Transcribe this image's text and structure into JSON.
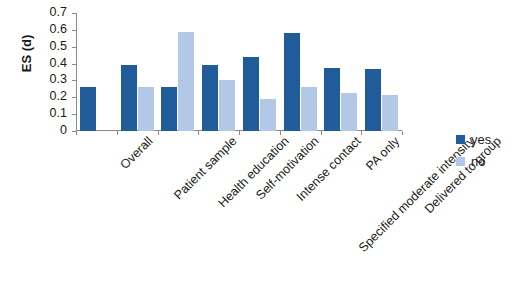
{
  "chart_data": {
    "type": "bar",
    "title": "",
    "subtitle": "",
    "xlabel": "",
    "ylabel": "ES (d)",
    "ylim": [
      0,
      0.7
    ],
    "ytick_labels": [
      "0.7",
      "0.6",
      "0.5",
      "0.4",
      "0.3",
      "0.2",
      "0.1",
      "0"
    ],
    "ytick_values": [
      0.7,
      0.6,
      0.5,
      0.4,
      0.3,
      0.2,
      0.1,
      0
    ],
    "grid": false,
    "legend_position": "right",
    "categories": [
      "Overall",
      "Patient sample",
      "Health education",
      "Self-motivation",
      "Intense contact",
      "Specified moderate intensity",
      "PA only",
      "Delivered to group"
    ],
    "series": [
      {
        "name": "yes",
        "color": "#1f5c99",
        "values": [
          0.26,
          0.39,
          0.26,
          0.39,
          0.44,
          0.58,
          0.375,
          0.365
        ]
      },
      {
        "name": "no",
        "color": "#b3c7e6",
        "values": [
          null,
          0.26,
          0.585,
          0.3,
          0.19,
          0.26,
          0.225,
          0.215
        ]
      }
    ]
  },
  "legend": {
    "items": [
      {
        "label": "yes",
        "color": "#1f5c99"
      },
      {
        "label": "no",
        "color": "#b3c7e6"
      }
    ]
  },
  "axis": {
    "y_title": "ES (d)"
  }
}
